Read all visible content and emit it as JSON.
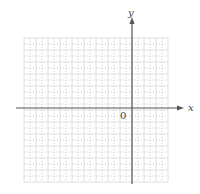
{
  "diagram": {
    "type": "coordinate-grid",
    "grid": {
      "left": 24,
      "top": 38,
      "cell": 12,
      "cols": 12,
      "rows": 12,
      "line_color": "#d8d8d8",
      "dotted_color": "#bbbbbb"
    },
    "axes": {
      "color": "#555555",
      "origin_px": [
        132,
        108
      ],
      "x_axis": {
        "from": 16,
        "to": 184,
        "label": "x"
      },
      "y_axis": {
        "from": 17,
        "to": 184,
        "label": "y"
      },
      "origin_label": "0"
    }
  }
}
